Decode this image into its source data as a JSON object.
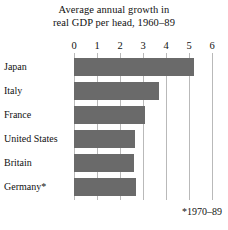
{
  "chart_data": {
    "type": "bar",
    "orientation": "horizontal",
    "title": "Average annual growth in real GDP per head, 1960–89",
    "title_lines": [
      "Average annual growth in",
      "real GDP per head, 1960–89"
    ],
    "categories": [
      "Japan",
      "Italy",
      "France",
      "United States",
      "Britain",
      "Germany*"
    ],
    "values": [
      5.2,
      3.7,
      3.1,
      2.65,
      2.6,
      2.7
    ],
    "series": [
      {
        "name": "Average annual growth in real GDP per head, 1960-89",
        "values": [
          5.2,
          3.7,
          3.1,
          2.65,
          2.6,
          2.7
        ]
      }
    ],
    "xlabel": "",
    "ylabel": "",
    "xlim": [
      0,
      6
    ],
    "xticks": [
      0,
      1,
      2,
      3,
      4,
      5,
      6
    ],
    "xtick_labels": [
      "0",
      "1",
      "2",
      "3",
      "4",
      "5",
      "6"
    ],
    "grid": true,
    "grid_axis": "x",
    "legend": false,
    "legend_position": "none",
    "bar_color": "#6a6a6a",
    "gridline_color": "#b9b9b9",
    "background_color": "#ffffff",
    "text_color": "#111111",
    "annotations": [
      "*1970–89"
    ]
  },
  "footnote": "*1970–89"
}
